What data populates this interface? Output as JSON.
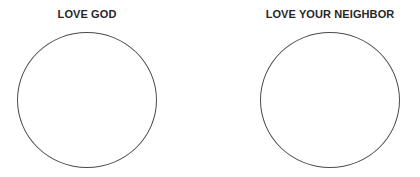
{
  "panels": [
    {
      "title": "LOVE GOD",
      "shape": "circle",
      "content": ""
    },
    {
      "title": "LOVE YOUR NEIGHBOR",
      "shape": "circle",
      "content": ""
    }
  ],
  "colors": {
    "background": "#ffffff",
    "text": "#2a2627",
    "stroke": "#4a4a4a"
  }
}
